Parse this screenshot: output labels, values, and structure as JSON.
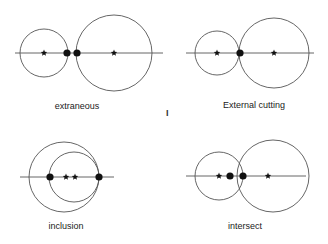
{
  "colors": {
    "stroke": "#555555",
    "point": "#111111",
    "background": "#ffffff"
  },
  "panels": [
    {
      "label": "extraneous",
      "label_pos": [
        77,
        101
      ],
      "line": [
        15,
        53,
        163,
        53
      ],
      "circles": [
        {
          "cx": 44,
          "cy": 53,
          "r": 24
        },
        {
          "cx": 114,
          "cy": 53,
          "r": 38
        }
      ],
      "dots": [
        {
          "x": 67,
          "y": 53
        },
        {
          "x": 77,
          "y": 53
        }
      ],
      "stars": [
        {
          "x": 44,
          "y": 53
        },
        {
          "x": 114,
          "y": 53
        }
      ]
    },
    {
      "label": "External cutting",
      "label_pos": [
        254,
        100
      ],
      "line": [
        186,
        53,
        314,
        53
      ],
      "circles": [
        {
          "cx": 217,
          "cy": 53,
          "r": 22
        },
        {
          "cx": 274,
          "cy": 53,
          "r": 35
        }
      ],
      "dots": [
        {
          "x": 240,
          "y": 53
        }
      ],
      "stars": [
        {
          "x": 217,
          "y": 53
        },
        {
          "x": 274,
          "y": 53
        }
      ]
    },
    {
      "label": "inclusion",
      "label_pos": [
        66,
        221
      ],
      "line": [
        20,
        177,
        114,
        177
      ],
      "circles": [
        {
          "cx": 64,
          "cy": 177,
          "r": 35
        },
        {
          "cx": 74,
          "cy": 177,
          "r": 25
        }
      ],
      "dots": [
        {
          "x": 50,
          "y": 177
        },
        {
          "x": 99,
          "y": 177
        }
      ],
      "stars": [
        {
          "x": 66,
          "y": 177
        },
        {
          "x": 75,
          "y": 177
        }
      ]
    },
    {
      "label": "intersect",
      "label_pos": [
        245,
        221
      ],
      "line": [
        186,
        176,
        306,
        176
      ],
      "circles": [
        {
          "cx": 219,
          "cy": 176,
          "r": 24
        },
        {
          "cx": 273,
          "cy": 176,
          "r": 36
        }
      ],
      "dots": [
        {
          "x": 230,
          "y": 176
        },
        {
          "x": 243,
          "y": 176
        }
      ],
      "stars": [
        {
          "x": 219,
          "y": 176
        },
        {
          "x": 268,
          "y": 176
        }
      ]
    }
  ],
  "marker": {
    "text": "I",
    "pos": [
      166,
      108
    ]
  }
}
